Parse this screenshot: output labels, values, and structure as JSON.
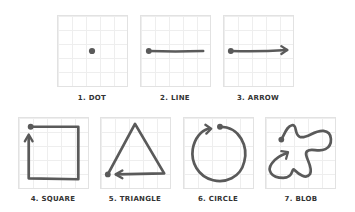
{
  "stroke_color": "#5a5a5a",
  "shapes": [
    {
      "id": "dot",
      "label": "1. DOT"
    },
    {
      "id": "line",
      "label": "2. LINE"
    },
    {
      "id": "arrow",
      "label": "3. ARROW"
    },
    {
      "id": "square",
      "label": "4. SQUARE"
    },
    {
      "id": "triangle",
      "label": "5. TRIANGLE"
    },
    {
      "id": "circle",
      "label": "6. CIRCLE"
    },
    {
      "id": "blob",
      "label": "7. BLOB"
    }
  ]
}
